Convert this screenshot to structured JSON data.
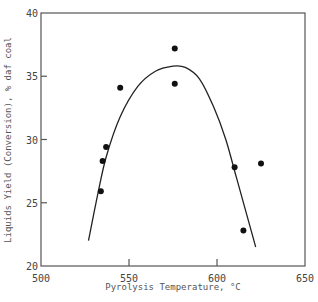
{
  "chart_data": {
    "type": "scatter",
    "title": "",
    "xlabel": "Pyrolysis Temperature, °C",
    "ylabel": "Liquids Yield (Conversion), % daf coal",
    "xlim": [
      500,
      650
    ],
    "ylim": [
      20,
      40
    ],
    "x_ticks": [
      500,
      550,
      600,
      650
    ],
    "y_ticks": [
      20,
      25,
      30,
      35,
      40
    ],
    "grid": false,
    "legend": null,
    "series": [
      {
        "name": "data",
        "kind": "points",
        "points": [
          {
            "x": 534,
            "y": 25.9
          },
          {
            "x": 535,
            "y": 28.3
          },
          {
            "x": 537,
            "y": 29.4
          },
          {
            "x": 545,
            "y": 34.1
          },
          {
            "x": 576,
            "y": 37.2
          },
          {
            "x": 576,
            "y": 34.4
          },
          {
            "x": 610,
            "y": 27.8
          },
          {
            "x": 615,
            "y": 22.8
          },
          {
            "x": 625,
            "y": 28.1
          }
        ]
      },
      {
        "name": "fit",
        "kind": "curve",
        "points": [
          {
            "x": 527,
            "y": 22.0
          },
          {
            "x": 532,
            "y": 25.5
          },
          {
            "x": 537,
            "y": 28.6
          },
          {
            "x": 545,
            "y": 31.8
          },
          {
            "x": 555,
            "y": 34.2
          },
          {
            "x": 565,
            "y": 35.4
          },
          {
            "x": 575,
            "y": 35.8
          },
          {
            "x": 582,
            "y": 35.7
          },
          {
            "x": 590,
            "y": 34.8
          },
          {
            "x": 598,
            "y": 32.6
          },
          {
            "x": 605,
            "y": 30.0
          },
          {
            "x": 611,
            "y": 27.0
          },
          {
            "x": 616,
            "y": 24.5
          },
          {
            "x": 620,
            "y": 22.5
          },
          {
            "x": 622,
            "y": 21.5
          }
        ]
      }
    ]
  },
  "labels": {
    "xlabel": "Pyrolysis Temperature, °C",
    "ylabel": "Liquids Yield (Conversion), % daf coal"
  }
}
